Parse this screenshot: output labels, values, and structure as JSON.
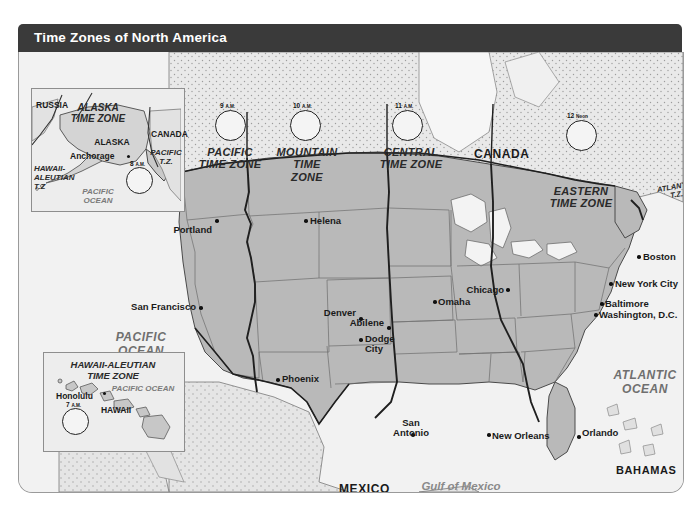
{
  "header": {
    "title": "Time Zones of North America"
  },
  "map": {
    "countries": [
      {
        "name": "CANADA",
        "x": 455,
        "y": 101
      },
      {
        "name": "MEXICO",
        "x": 338,
        "y": 437
      },
      {
        "name": "BAHAMAS",
        "x": 616,
        "y": 420
      },
      {
        "name": "CUBA",
        "x": 626,
        "y": 461
      }
    ],
    "oceans": [
      {
        "name": "PACIFIC\nOCEAN",
        "x": 122,
        "y": 290
      },
      {
        "name": "ATLANTIC\nOCEAN",
        "x": 626,
        "y": 328
      }
    ],
    "seas": [
      {
        "name": "Gulf of Mexico",
        "x": 442,
        "y": 435
      }
    ],
    "time_zones": [
      {
        "name": "PACIFIC\nTIME ZONE",
        "x": 211,
        "y": 104
      },
      {
        "name": "MOUNTAIN\nTIME\nZONE",
        "x": 288,
        "y": 104
      },
      {
        "name": "CENTRAL\nTIME ZONE",
        "x": 390,
        "y": 104
      },
      {
        "name": "EASTERN\nTIME ZONE",
        "x": 560,
        "y": 143
      },
      {
        "name": "ATLANTIC\nT.Z.",
        "x": 654,
        "y": 140
      }
    ],
    "clocks": [
      {
        "label": "9",
        "suffix": "A.M.",
        "x": 212,
        "y": 68,
        "r": 16,
        "hour": 9,
        "minute": 0
      },
      {
        "label": "10",
        "suffix": "A.M.",
        "x": 287,
        "y": 68,
        "r": 16,
        "hour": 10,
        "minute": 0
      },
      {
        "label": "11",
        "suffix": "A.M.",
        "x": 389,
        "y": 68,
        "r": 16,
        "hour": 11,
        "minute": 0
      },
      {
        "label": "12",
        "suffix": "Noon",
        "x": 563,
        "y": 78,
        "r": 16,
        "hour": 12,
        "minute": 0
      }
    ],
    "cities": [
      {
        "name": "Portland",
        "x": 196,
        "y": 174,
        "align": "right"
      },
      {
        "name": "Helena",
        "x": 291,
        "y": 167,
        "align": "left"
      },
      {
        "name": "San Francisco",
        "x": 180,
        "y": 254,
        "align": "right"
      },
      {
        "name": "Denver",
        "x": 338,
        "y": 262,
        "align": "right"
      },
      {
        "name": "Abilene",
        "x": 368,
        "y": 271,
        "align": "right"
      },
      {
        "name": "Dodge\nCity",
        "x": 377,
        "y": 291,
        "align": "left"
      },
      {
        "name": "Omaha",
        "x": 417,
        "y": 248,
        "align": "left"
      },
      {
        "name": "Chicago",
        "x": 484,
        "y": 236,
        "align": "right"
      },
      {
        "name": "Boston",
        "x": 627,
        "y": 203,
        "align": "left"
      },
      {
        "name": "New York City",
        "x": 593,
        "y": 230,
        "align": "left"
      },
      {
        "name": "Baltimore",
        "x": 585,
        "y": 250,
        "align": "left"
      },
      {
        "name": "Washington, D.C.",
        "x": 581,
        "y": 261,
        "align": "left"
      },
      {
        "name": "Phoenix",
        "x": 263,
        "y": 324,
        "align": "left"
      },
      {
        "name": "San\nAntonio",
        "x": 397,
        "y": 373,
        "align": "left"
      },
      {
        "name": "New Orleans",
        "x": 472,
        "y": 383,
        "align": "left"
      },
      {
        "name": "Orlando",
        "x": 564,
        "y": 380,
        "align": "left"
      }
    ]
  },
  "inset_alaska": {
    "box": {
      "x": 30,
      "y": 88,
      "w": 150,
      "h": 122
    },
    "labels": [
      {
        "text": "RUSSIA",
        "x": 37,
        "y": 100,
        "kind": "bold"
      },
      {
        "text": "ALASKA\nTIME ZONE",
        "x": 98,
        "y": 103,
        "kind": "italic"
      },
      {
        "text": "CANADA",
        "x": 143,
        "y": 128,
        "kind": "bold"
      },
      {
        "text": "ALASKA",
        "x": 104,
        "y": 135,
        "kind": "bold"
      },
      {
        "text": "Anchorage",
        "x": 60,
        "y": 150,
        "kind": "bold"
      },
      {
        "text": "PACIFIC\nT.Z.",
        "x": 155,
        "y": 147,
        "kind": "italic"
      },
      {
        "text": "HAWAII-\nALEUTIAN\nT.Z",
        "x": 33,
        "y": 163,
        "kind": "italic-left"
      },
      {
        "text": "PACIFIC\nOCEAN",
        "x": 98,
        "y": 186,
        "kind": "ocean"
      }
    ],
    "clock": {
      "label": "8",
      "suffix": "A.M.",
      "x": 124,
      "y": 184,
      "r": 14,
      "hour": 8,
      "minute": 0
    }
  },
  "inset_hawaii": {
    "box": {
      "x": 42,
      "y": 352,
      "w": 138,
      "h": 98
    },
    "labels": [
      {
        "text": "HAWAII-ALEUTIAN\nTIME ZONE",
        "x": 113,
        "y": 360,
        "kind": "italic"
      },
      {
        "text": "Honolulu",
        "x": 80,
        "y": 392,
        "kind": "bold"
      },
      {
        "text": "HAWAII",
        "x": 116,
        "y": 406,
        "kind": "bold"
      },
      {
        "text": "PACIFIC  OCEAN",
        "x": 142,
        "y": 386,
        "kind": "ocean"
      }
    ],
    "clock": {
      "label": "7",
      "suffix": "A.M.",
      "x": 72,
      "y": 424,
      "r": 14,
      "hour": 7,
      "minute": 0
    }
  },
  "colors": {
    "title_bar": "#3a3a3a",
    "title_text": "#ffffff",
    "land_us": "#b9b9b9",
    "land_other": "#d8d8d8",
    "water": "#f2f2f2",
    "panel_bg": "#e8e8e8",
    "border": "#555555"
  }
}
